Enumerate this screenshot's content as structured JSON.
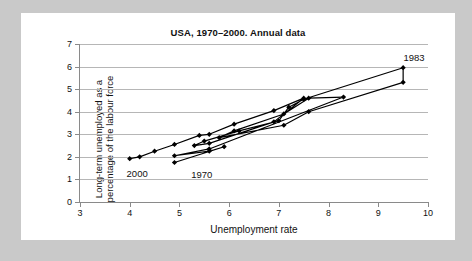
{
  "chart_data": {
    "type": "scatter",
    "title": "USA, 1970–2000. Annual data",
    "xlabel": "Unemployment rate",
    "ylabel_line1": "Long-term unemployed as a",
    "ylabel_line2": "percentage of the labour force",
    "xlim": [
      3,
      10
    ],
    "ylim": [
      0,
      7
    ],
    "xticks": [
      3,
      4,
      5,
      6,
      7,
      8,
      9,
      10
    ],
    "yticks": [
      0,
      1,
      2,
      3,
      4,
      5,
      6,
      7
    ],
    "grid": "horizontal",
    "legend": "none",
    "marker": "diamond",
    "line_color": "#000000",
    "grid_color": "#b6b6b6",
    "axis_color": "#8a8a8a",
    "series": [
      {
        "name": "USA annual path 1970–2000",
        "points": [
          {
            "year": 1970,
            "x": 4.9,
            "y": 1.75
          },
          {
            "year": 1971,
            "x": 5.9,
            "y": 2.45
          },
          {
            "year": 1972,
            "x": 5.6,
            "y": 2.25
          },
          {
            "year": 1973,
            "x": 4.9,
            "y": 2.05
          },
          {
            "year": 1974,
            "x": 5.6,
            "y": 2.35
          },
          {
            "year": 1975,
            "x": 8.3,
            "y": 4.65
          },
          {
            "year": 1976,
            "x": 7.6,
            "y": 4.6
          },
          {
            "year": 1977,
            "x": 7.1,
            "y": 3.9
          },
          {
            "year": 1978,
            "x": 6.1,
            "y": 3.15
          },
          {
            "year": 1979,
            "x": 5.8,
            "y": 2.85
          },
          {
            "year": 1980,
            "x": 7.1,
            "y": 3.4
          },
          {
            "year": 1981,
            "x": 7.6,
            "y": 4.0
          },
          {
            "year": 1982,
            "x": 9.5,
            "y": 5.3
          },
          {
            "year": 1983,
            "x": 9.5,
            "y": 5.95
          },
          {
            "year": 1984,
            "x": 7.5,
            "y": 4.55
          },
          {
            "year": 1985,
            "x": 7.2,
            "y": 4.2
          },
          {
            "year": 1986,
            "x": 7.0,
            "y": 3.6
          },
          {
            "year": 1987,
            "x": 6.2,
            "y": 3.15
          },
          {
            "year": 1988,
            "x": 5.5,
            "y": 2.7
          },
          {
            "year": 1989,
            "x": 5.3,
            "y": 2.5
          },
          {
            "year": 1990,
            "x": 5.6,
            "y": 2.6
          },
          {
            "year": 1991,
            "x": 6.9,
            "y": 3.55
          },
          {
            "year": 1992,
            "x": 7.5,
            "y": 4.6
          },
          {
            "year": 1993,
            "x": 6.9,
            "y": 4.05
          },
          {
            "year": 1994,
            "x": 6.1,
            "y": 3.45
          },
          {
            "year": 1995,
            "x": 5.6,
            "y": 3.0
          },
          {
            "year": 1996,
            "x": 5.4,
            "y": 2.95
          },
          {
            "year": 1997,
            "x": 4.9,
            "y": 2.55
          },
          {
            "year": 1998,
            "x": 4.5,
            "y": 2.25
          },
          {
            "year": 1999,
            "x": 4.2,
            "y": 2.0
          },
          {
            "year": 2000,
            "x": 4.0,
            "y": 1.92
          }
        ]
      }
    ],
    "annotations": [
      {
        "label": "2000",
        "x": 4.15,
        "y": 1.3
      },
      {
        "label": "1970",
        "x": 5.45,
        "y": 1.22
      },
      {
        "label": "1983",
        "x": 9.72,
        "y": 6.42
      }
    ]
  }
}
